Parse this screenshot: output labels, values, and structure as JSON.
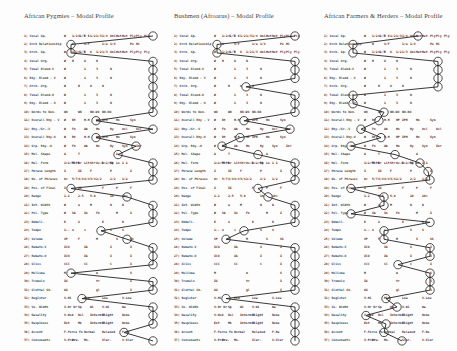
{
  "panels": [
    {
      "title": "African Pygmies – Modal Profile",
      "circle_x": [
        153,
        71,
        71,
        153,
        153,
        153,
        153,
        153,
        153,
        153,
        96,
        153,
        96,
        136,
        118,
        153,
        153,
        153,
        71,
        127,
        153,
        153,
        153,
        101,
        127,
        153,
        153,
        153,
        71,
        153,
        153,
        82,
        153,
        153,
        153,
        124,
        153
      ]
    },
    {
      "title": "Bushmen (Afroarus) – Modal Profile",
      "circle_x": [
        295,
        217,
        217,
        295,
        295,
        295,
        246,
        295,
        295,
        295,
        244,
        290,
        240,
        222,
        258,
        295,
        295,
        295,
        258,
        268,
        295,
        295,
        295,
        244,
        226,
        295,
        295,
        295,
        295,
        295,
        295,
        226,
        295,
        295,
        295,
        295,
        295
      ]
    },
    {
      "title": "African Farmers & Herders – Modal Profile",
      "circle_x": [
        418,
        353,
        353,
        438,
        438,
        438,
        438,
        353,
        353,
        384,
        379,
        361,
        381,
        351,
        395,
        420,
        428,
        430,
        351,
        384,
        384,
        351,
        430,
        384,
        384,
        430,
        430,
        398,
        430,
        430,
        430,
        386,
        397,
        366,
        386,
        384,
        402
      ]
    }
  ],
  "rows": [
    {
      "label": "1) Vocal Gp.",
      "cells": [
        "#",
        "1/2 1/3",
        "4",
        "5 6",
        "1/2",
        "1/3",
        "1/4",
        "Uni",
        "Het",
        "Het",
        "Ply",
        "Ply",
        "Ply"
      ]
    },
    {
      "label": "2) Orch Relationship",
      "cells": [
        "",
        "N",
        "",
        "V/F",
        "",
        "",
        "1/u",
        "1/V",
        "",
        "",
        "Po",
        "Hi"
      ]
    },
    {
      "label": "3) Orch. Gp.",
      "cells": [
        "#",
        "1/2 1/3",
        "4",
        "5",
        "6",
        "1/2",
        "1/3",
        "Uni",
        "Het",
        "Het",
        "Ply",
        "Ply",
        "Ply"
      ]
    },
    {
      "label": "4) Vocal Org.",
      "cells": [
        "#",
        "H",
        "",
        "U",
        "",
        "N"
      ]
    },
    {
      "label": "5) Tonal Blend-V",
      "cells": [
        "#",
        "",
        "",
        "1",
        "",
        "3",
        "",
        "N"
      ]
    },
    {
      "label": "6) Rhy. Blend - V",
      "cells": [
        "#",
        "",
        "",
        "1",
        "",
        "3",
        "",
        "N"
      ]
    },
    {
      "label": "7) Orch. Org.",
      "cells": [
        "#",
        "",
        "H",
        "",
        "U",
        "",
        "N"
      ]
    },
    {
      "label": "8) Tonal Blend-O",
      "cells": [
        "#",
        "",
        "",
        "1",
        "",
        "3",
        "",
        "N"
      ]
    },
    {
      "label": "9) Rhy. Blend - O",
      "cells": [
        "#",
        "",
        "",
        "1",
        "",
        "3",
        "",
        "N"
      ]
    },
    {
      "label": "10) Words to Non.",
      "cells": [
        "WO",
        "",
        "WN",
        "",
        "NN-WO",
        "",
        "NN-NO"
      ]
    },
    {
      "label": "11) Overall Rhy - V",
      "cells": [
        "#",
        "Bt",
        "",
        "H-H",
        "",
        "HP",
        "IPH",
        "",
        "Hn",
        "",
        "Syn"
      ]
    },
    {
      "label": "12) Rhy./Gr.-V",
      "cells": [
        "#",
        "Fn",
        "",
        "Ab",
        "",
        "Hn",
        "",
        "Ry",
        "",
        "Ovl",
        "",
        "Ovl"
      ]
    },
    {
      "label": "13) Overall Rhy-O",
      "cells": [
        "#",
        "Bt",
        "",
        "H-H",
        "",
        "HP",
        "IPH",
        "",
        "Hn",
        "",
        "Syn"
      ]
    },
    {
      "label": "14) Grp. Rhy.-O",
      "cells": [
        "#",
        "Fn",
        "",
        "Ab",
        "",
        "Hn",
        "",
        "Ry",
        "",
        "Syn",
        "",
        "Inr"
      ]
    },
    {
      "label": "15) Mel. Shape",
      "cells": [
        "A",
        "",
        "T",
        "",
        "",
        "",
        "",
        "",
        "A"
      ]
    },
    {
      "label": "16) Mel. Form",
      "cells": [
        "1<2/P5",
        "3<P4",
        "Br",
        "Lit",
        "Str",
        "Ov-R",
        "1<2/P4",
        "Sp",
        "Lo",
        "1 1"
      ]
    },
    {
      "label": "17) Phrase Length",
      "cells": [
        "I",
        "",
        "II",
        "",
        "F",
        "",
        "",
        "P",
        "",
        "",
        "I"
      ]
    },
    {
      "label": "18) No. of Phrases",
      "cells": [
        "8+",
        "5/7",
        "4/4",
        "4/4",
        "3/4",
        "2/2",
        "",
        "2/2",
        "",
        "1/2"
      ]
    },
    {
      "label": "19) Pos. of Final",
      "cells": [
        "I",
        "",
        "II",
        "",
        "",
        "",
        "F",
        "",
        "P",
        "",
        "F"
      ]
    },
    {
      "label": "20) Range",
      "cells": [
        "1-2",
        "",
        "2-5",
        "",
        "5-8",
        "",
        "",
        "10",
        "",
        "10+"
      ]
    },
    {
      "label": "21) Int. Width",
      "cells": [
        "#",
        "",
        "u",
        "",
        "M",
        "",
        "",
        "N",
        "",
        "D"
      ]
    },
    {
      "label": "22) Pol. Type",
      "cells": [
        "#",
        "SA",
        "",
        "In",
        "",
        "Fn",
        "",
        "",
        "M",
        "",
        "I"
      ]
    },
    {
      "label": "23) Embell.",
      "cells": [
        "E",
        "",
        "X",
        "",
        "",
        "",
        "E",
        "",
        "",
        "B"
      ]
    },
    {
      "label": "24) Tempo",
      "cells": [
        "1--",
        "n",
        "",
        "s",
        "",
        "",
        "",
        "S",
        "",
        "S"
      ]
    },
    {
      "label": "25) Volume",
      "cells": [
        "VP",
        "",
        "F",
        "",
        "",
        "M",
        "",
        "",
        "S",
        "",
        "SS"
      ]
    },
    {
      "label": "26) Rubato-V",
      "cells": [
        "ICO",
        "",
        "",
        "IA",
        "",
        "",
        "",
        "I",
        "",
        "",
        "I"
      ]
    },
    {
      "label": "27) Rubato-O",
      "cells": [
        "ICO",
        "",
        "",
        "IA",
        "",
        "",
        "",
        "I",
        "",
        "",
        "I"
      ]
    },
    {
      "label": "28) Gliss",
      "cells": [
        "CCC",
        "",
        "",
        "CC",
        "",
        "",
        "",
        "C",
        "",
        "",
        "I"
      ]
    },
    {
      "label": "29) Melisma",
      "cells": [
        "M",
        "",
        "",
        "",
        "",
        "m",
        "",
        "",
        "",
        "",
        "S"
      ]
    },
    {
      "label": "30) Tremolo",
      "cells": [
        "IX",
        "",
        "",
        "",
        "",
        "tr",
        "",
        "",
        "",
        "",
        "I"
      ]
    },
    {
      "label": "31) Glottal Sh.",
      "cells": [
        "GG",
        "",
        "",
        "",
        "",
        "gl",
        "",
        "",
        "",
        "",
        "I"
      ]
    },
    {
      "label": "32) Register",
      "cells": [
        "V-Hi",
        "",
        "",
        "Mid",
        "",
        "",
        "Low",
        "",
        "",
        "V-Low"
      ]
    },
    {
      "label": "33) Vo. Width",
      "cells": [
        "V-Nr Nr",
        "",
        "Sp",
        "",
        "Wi",
        "",
        "V-Wi",
        "",
        "",
        "Wa"
      ]
    },
    {
      "label": "34) Nasality",
      "cells": [
        "V-Nsd",
        "",
        "Nsl",
        "",
        "Intermit.",
        "",
        "Slight",
        "",
        "",
        "None"
      ]
    },
    {
      "label": "35) Raspiness",
      "cells": [
        "Ext",
        "",
        "Mk",
        "",
        "Intermit.",
        "",
        "Slight",
        "",
        "",
        "None"
      ]
    },
    {
      "label": "36) Accent",
      "cells": [
        "F.Force Fo",
        "",
        "",
        "Normal",
        "",
        "",
        "Relaxed",
        "",
        "",
        "F-Re"
      ]
    },
    {
      "label": "37) Consonants",
      "cells": [
        "V-Prec.",
        "Pre.",
        "",
        "Mo.",
        "",
        "",
        "Slur.",
        "",
        "",
        "V-Slur"
      ]
    }
  ],
  "cell_columns": [
    0,
    8,
    14,
    20,
    26,
    32,
    38,
    46,
    52,
    58,
    66,
    72,
    80
  ]
}
